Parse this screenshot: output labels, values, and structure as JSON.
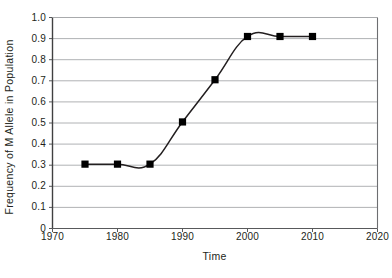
{
  "chart_data": {
    "type": "line",
    "title": "",
    "subtitle": "",
    "xlabel": "Time",
    "ylabel": "Frequency of M Allele in Population",
    "xlim": [
      1970,
      2020
    ],
    "ylim": [
      0,
      1.0
    ],
    "xticks": [
      "1970",
      "1980",
      "1990",
      "2000",
      "2010",
      "2020"
    ],
    "xtick_values": [
      1970,
      1980,
      1990,
      2000,
      2010,
      2020
    ],
    "yticks": [
      "0",
      "0.1",
      "0.2",
      "0.3",
      "0.4",
      "0.5",
      "0.6",
      "0.7",
      "0.8",
      "0.9",
      "1.0"
    ],
    "ytick_values": [
      0,
      0.1,
      0.2,
      0.3,
      0.4,
      0.5,
      0.6,
      0.7,
      0.8,
      0.9,
      1.0
    ],
    "grid": "horizontal",
    "legend": "none",
    "marker": "filled-square",
    "line_color": "#231f20",
    "marker_color": "#000000",
    "grid_color": "#a7a9ac",
    "axis_color": "#58595b",
    "series": [
      {
        "name": "Frequency of M Allele",
        "x": [
          1975,
          1980,
          1985,
          1990,
          1995,
          2000,
          2005,
          2010
        ],
        "values": [
          0.305,
          0.305,
          0.305,
          0.505,
          0.705,
          0.91,
          0.91,
          0.91
        ]
      }
    ],
    "annotations": []
  },
  "axis_titles": {
    "x": "Time",
    "y": "Frequency of M Allele in Population"
  }
}
